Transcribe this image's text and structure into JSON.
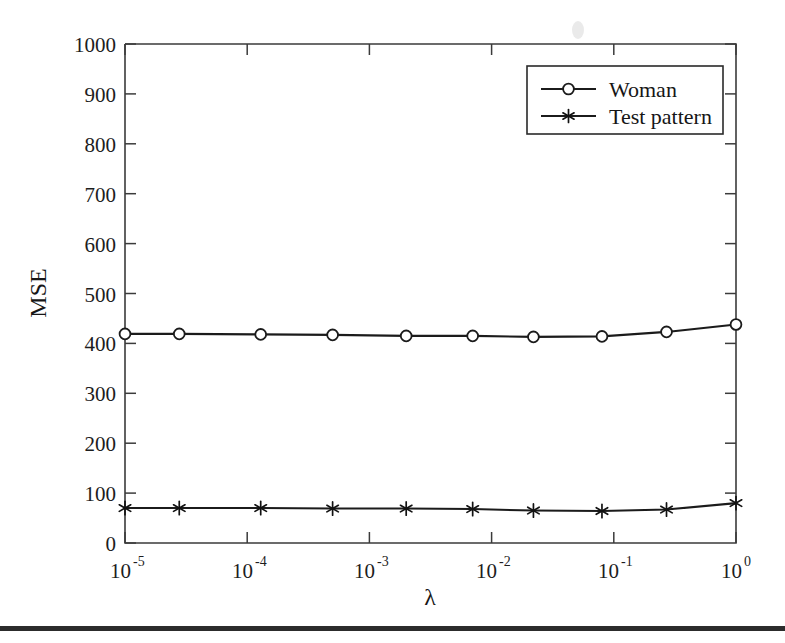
{
  "figure": {
    "background_color": "#ffffff",
    "ink_color": "#1b1b1b"
  },
  "chart_data": {
    "type": "line",
    "title": "",
    "subtitle": "",
    "xlabel": "λ",
    "ylabel": "MSE",
    "xscale": "log",
    "yscale": "linear",
    "xlim": [
      1e-05,
      1
    ],
    "ylim": [
      0,
      1000
    ],
    "grid": false,
    "legend_position": "upper right",
    "x_tick_labels": [
      "10−5",
      "10−4",
      "10−3",
      "10−2",
      "10−1",
      "10⁰"
    ],
    "x_tick_bases": [
      "10",
      "10",
      "10",
      "10",
      "10",
      "10"
    ],
    "x_tick_exponents": [
      "-5",
      "-4",
      "-3",
      "-2",
      "-1",
      "0"
    ],
    "x_tick_values": [
      1e-05,
      0.0001,
      0.001,
      0.01,
      0.1,
      1
    ],
    "y_tick_labels": [
      "0",
      "100",
      "200",
      "300",
      "400",
      "500",
      "600",
      "700",
      "800",
      "900",
      "1000"
    ],
    "y_tick_values": [
      0,
      100,
      200,
      300,
      400,
      500,
      600,
      700,
      800,
      900,
      1000
    ],
    "x": [
      1e-05,
      2.78e-05,
      0.000129,
      0.0005,
      0.002,
      0.007,
      0.022,
      0.08,
      0.27,
      1.0
    ],
    "series": [
      {
        "name": "Woman",
        "marker": "circle-open",
        "color": "#1b1b1b",
        "values": [
          419,
          419,
          418,
          417,
          415,
          415,
          413,
          414,
          423,
          438
        ]
      },
      {
        "name": "Test pattern",
        "marker": "star",
        "color": "#1b1b1b",
        "values": [
          70,
          70,
          70,
          69,
          69,
          68,
          65,
          64,
          67,
          80
        ]
      }
    ],
    "annotations": []
  },
  "legend": {
    "entries": [
      {
        "label": "Woman",
        "marker": "circle-open"
      },
      {
        "label": "Test pattern",
        "marker": "star"
      }
    ]
  }
}
